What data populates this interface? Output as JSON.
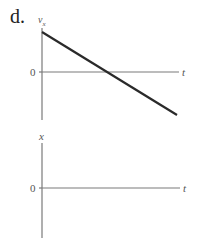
{
  "problem": {
    "label": "d."
  },
  "top_graph": {
    "y_axis_label": "v",
    "y_axis_subscript": "x",
    "x_axis_label": "t",
    "origin_label": "0",
    "line": {
      "description": "straight line with negative slope, starting positive at t=0 and crossing zero",
      "start": {
        "x": 42,
        "y": 32
      },
      "end": {
        "x": 177,
        "y": 115
      }
    }
  },
  "bottom_graph": {
    "y_axis_label": "x",
    "x_axis_label": "t",
    "origin_label": "0",
    "line": null
  },
  "colors": {
    "axis": "#7a7a7a",
    "data_line": "#2a2a2a",
    "text": "#555555"
  }
}
